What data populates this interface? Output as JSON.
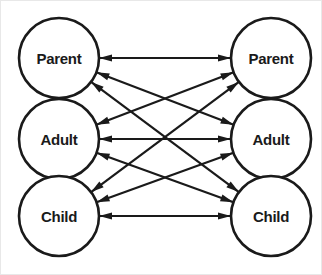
{
  "diagram": {
    "background_color": "#ffffff",
    "frame_border_color": "#e8e8e8",
    "line_color": "#1a1a1a",
    "node_fill_color": "#ffffff",
    "node_stroke_color": "#1a1a1a",
    "label_color": "#1a1a1a",
    "left_column": {
      "name": "person-a",
      "center_x": 58,
      "nodes": [
        {
          "id": "left-parent",
          "label": "Parent",
          "cx": 58,
          "cy": 57,
          "r": 40
        },
        {
          "id": "left-adult",
          "label": "Adult",
          "cx": 58,
          "cy": 138,
          "r": 40
        },
        {
          "id": "left-child",
          "label": "Child",
          "cx": 58,
          "cy": 215,
          "r": 40
        }
      ]
    },
    "right_column": {
      "name": "person-b",
      "center_x": 270,
      "nodes": [
        {
          "id": "right-parent",
          "label": "Parent",
          "cx": 270,
          "cy": 57,
          "r": 40
        },
        {
          "id": "right-adult",
          "label": "Adult",
          "cx": 270,
          "cy": 138,
          "r": 40
        },
        {
          "id": "right-child",
          "label": "Child",
          "cx": 270,
          "cy": 215,
          "r": 40
        }
      ]
    },
    "links": [
      {
        "id": "link-parent-parent",
        "from": "left-parent",
        "to": "right-parent",
        "arrows": "both"
      },
      {
        "id": "link-parent-adult",
        "from": "left-parent",
        "to": "right-adult",
        "arrows": "both"
      },
      {
        "id": "link-parent-child",
        "from": "left-parent",
        "to": "right-child",
        "arrows": "both"
      },
      {
        "id": "link-adult-parent",
        "from": "left-adult",
        "to": "right-parent",
        "arrows": "both"
      },
      {
        "id": "link-adult-adult",
        "from": "left-adult",
        "to": "right-adult",
        "arrows": "both"
      },
      {
        "id": "link-adult-child",
        "from": "left-adult",
        "to": "right-child",
        "arrows": "both"
      },
      {
        "id": "link-child-parent",
        "from": "left-child",
        "to": "right-parent",
        "arrows": "both"
      },
      {
        "id": "link-child-adult",
        "from": "left-child",
        "to": "right-adult",
        "arrows": "both"
      },
      {
        "id": "link-child-child",
        "from": "left-child",
        "to": "right-child",
        "arrows": "both"
      }
    ]
  }
}
